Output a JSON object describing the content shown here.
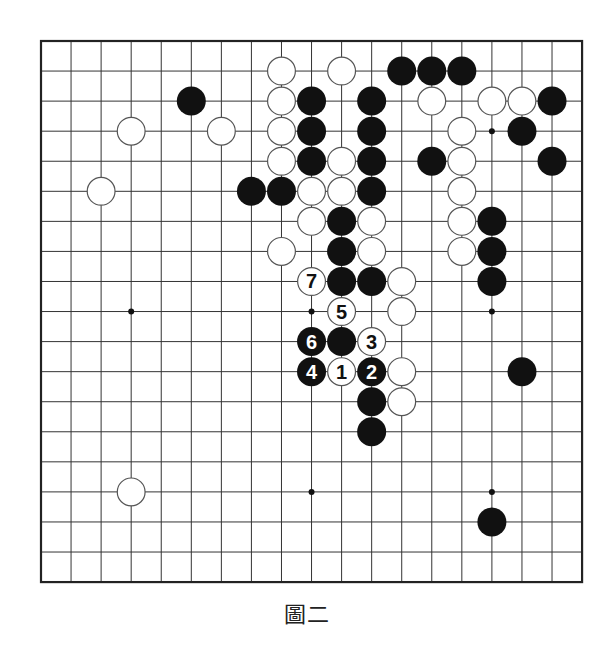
{
  "caption": "圖二",
  "board": {
    "size": 19,
    "origin_px": [
      41,
      41
    ],
    "spacing_px": 30.06,
    "stone_diameter_px": 29,
    "colors": {
      "background": "#ffffff",
      "grid": "#333333",
      "border": "#222222",
      "black_stone": "#111111",
      "white_stone_fill": "#ffffff",
      "white_stone_stroke": "#555555",
      "hoshi": "#111111"
    },
    "hoshi": [
      [
        3,
        9
      ],
      [
        9,
        9
      ],
      [
        15,
        9
      ],
      [
        9,
        15
      ],
      [
        15,
        15
      ],
      [
        15,
        3
      ],
      [
        3,
        3
      ],
      [
        9,
        3
      ],
      [
        3,
        15
      ]
    ],
    "black_stones": [
      [
        12,
        1
      ],
      [
        13,
        1
      ],
      [
        14,
        1
      ],
      [
        5,
        2
      ],
      [
        9,
        2
      ],
      [
        11,
        2
      ],
      [
        17,
        2
      ],
      [
        9,
        3
      ],
      [
        11,
        3
      ],
      [
        16,
        3
      ],
      [
        9,
        4
      ],
      [
        11,
        4
      ],
      [
        13,
        4
      ],
      [
        17,
        4
      ],
      [
        7,
        5
      ],
      [
        8,
        5
      ],
      [
        11,
        5
      ],
      [
        10,
        6
      ],
      [
        15,
        6
      ],
      [
        10,
        7
      ],
      [
        15,
        7
      ],
      [
        10,
        8
      ],
      [
        11,
        8
      ],
      [
        15,
        8
      ],
      [
        10,
        10
      ],
      [
        16,
        11
      ],
      [
        11,
        12
      ],
      [
        11,
        13
      ],
      [
        15,
        16
      ]
    ],
    "white_stones": [
      [
        8,
        1
      ],
      [
        10,
        1
      ],
      [
        8,
        2
      ],
      [
        13,
        2
      ],
      [
        15,
        2
      ],
      [
        16,
        2
      ],
      [
        3,
        3
      ],
      [
        6,
        3
      ],
      [
        8,
        3
      ],
      [
        14,
        3
      ],
      [
        8,
        4
      ],
      [
        10,
        4
      ],
      [
        14,
        4
      ],
      [
        2,
        5
      ],
      [
        9,
        5
      ],
      [
        10,
        5
      ],
      [
        14,
        5
      ],
      [
        9,
        6
      ],
      [
        11,
        6
      ],
      [
        14,
        6
      ],
      [
        8,
        7
      ],
      [
        11,
        7
      ],
      [
        14,
        7
      ],
      [
        12,
        8
      ],
      [
        12,
        9
      ],
      [
        12,
        11
      ],
      [
        12,
        12
      ],
      [
        3,
        15
      ]
    ],
    "numbered_moves": [
      {
        "label": "1",
        "color": "white",
        "col": 10,
        "row": 11
      },
      {
        "label": "2",
        "color": "black",
        "col": 11,
        "row": 11
      },
      {
        "label": "3",
        "color": "white",
        "col": 11,
        "row": 10
      },
      {
        "label": "4",
        "color": "black",
        "col": 9,
        "row": 11
      },
      {
        "label": "5",
        "color": "white",
        "col": 10,
        "row": 9
      },
      {
        "label": "6",
        "color": "black",
        "col": 9,
        "row": 10
      },
      {
        "label": "7",
        "color": "white",
        "col": 9,
        "row": 8
      }
    ]
  }
}
